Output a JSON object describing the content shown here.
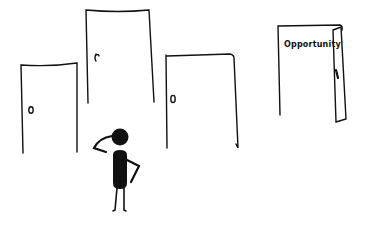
{
  "scene": {
    "description": "Hand-drawn illustration of a stick figure scratching its head, facing several closed doors and one open door labeled Opportunity",
    "doors": [
      {
        "id": "door-1",
        "state": "closed",
        "label": ""
      },
      {
        "id": "door-2",
        "state": "closed",
        "label": ""
      },
      {
        "id": "door-3",
        "state": "closed",
        "label": ""
      },
      {
        "id": "door-4",
        "state": "open",
        "label": "Opportunity"
      }
    ],
    "figure": {
      "pose": "scratching-head"
    }
  },
  "colors": {
    "ink": "#111111",
    "background": "#ffffff"
  }
}
